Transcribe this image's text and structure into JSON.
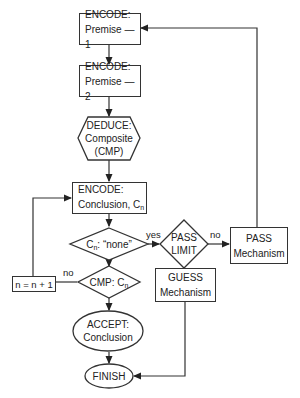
{
  "flowchart": {
    "nodes": {
      "encode_premise1": {
        "line1": "ENCODE:",
        "line2": "Premise — 1"
      },
      "encode_premise2": {
        "line1": "ENCODE:",
        "line2": "Premise — 2"
      },
      "deduce": {
        "line1": "DEDUCE:",
        "line2": "Composite",
        "line3": "(CMP)"
      },
      "encode_conclusion": {
        "line1": "ENCODE:",
        "line2": "Conclusion, C",
        "subscript": "n"
      },
      "decision_none": {
        "prefix": "C",
        "subscript": "n",
        "text": ": “none”"
      },
      "decision_cmp": {
        "text": "CMP: C",
        "subscript": "n"
      },
      "pass_limit": {
        "line1": "PASS",
        "line2": "LIMIT"
      },
      "pass_mechanism": {
        "line1": "PASS",
        "line2": "Mechanism"
      },
      "guess_mechanism": {
        "line1": "GUESS",
        "line2": "Mechanism"
      },
      "increment": {
        "text": "n = n + 1"
      },
      "accept": {
        "line1": "ACCEPT:",
        "line2": "Conclusion"
      },
      "finish": {
        "text": "FINISH"
      }
    },
    "edge_labels": {
      "none_yes": "yes",
      "pass_limit_no": "no",
      "cmp_no": "no"
    }
  }
}
